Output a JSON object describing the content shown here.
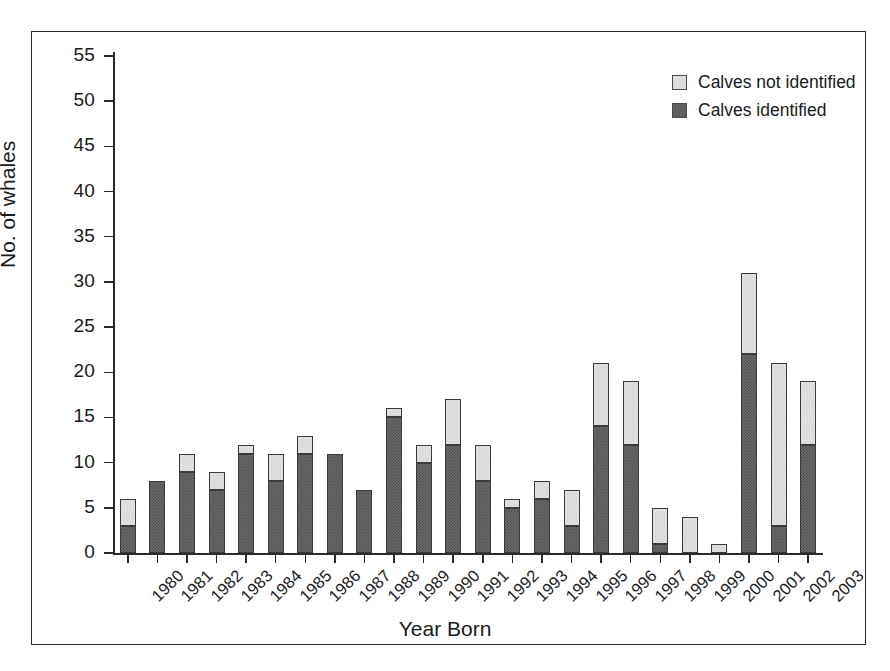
{
  "chart_data": {
    "type": "bar",
    "stacked": true,
    "title": "",
    "xlabel": "Year Born",
    "ylabel": "No. of whales",
    "ylim": [
      0,
      55
    ],
    "ytick_step": 5,
    "yticks": [
      0,
      5,
      10,
      15,
      20,
      25,
      30,
      35,
      40,
      45,
      50,
      55
    ],
    "grid": false,
    "legend_position": "top-right",
    "categories": [
      "1980",
      "1981",
      "1982",
      "1983",
      "1984",
      "1985",
      "1986",
      "1987",
      "1988",
      "1989",
      "1990",
      "1991",
      "1992",
      "1993",
      "1994",
      "1995",
      "1996",
      "1997",
      "1998",
      "1999",
      "2000",
      "2001",
      "2002",
      "2003"
    ],
    "series": [
      {
        "name": "Calves identified",
        "color": "#6a6a6a",
        "values": [
          3,
          8,
          9,
          7,
          11,
          8,
          11,
          11,
          7,
          15,
          10,
          12,
          8,
          5,
          6,
          3,
          14,
          12,
          1,
          0,
          0,
          22,
          3,
          12
        ]
      },
      {
        "name": "Calves not identified",
        "color": "#e4e4e4",
        "values": [
          3,
          0,
          2,
          2,
          1,
          3,
          2,
          0,
          0,
          1,
          2,
          5,
          4,
          1,
          2,
          4,
          7,
          7,
          4,
          4,
          1,
          9,
          18,
          7
        ]
      }
    ],
    "totals": [
      6,
      8,
      11,
      9,
      12,
      11,
      13,
      11,
      7,
      16,
      12,
      17,
      12,
      6,
      8,
      7,
      21,
      19,
      5,
      4,
      1,
      31,
      21,
      19
    ]
  },
  "legend": {
    "items": [
      {
        "label": "Calves not identified",
        "swatch": "light"
      },
      {
        "label": "Calves identified",
        "swatch": "dark"
      }
    ]
  },
  "axes": {
    "x_title": "Year Born",
    "y_title": "No. of whales"
  }
}
